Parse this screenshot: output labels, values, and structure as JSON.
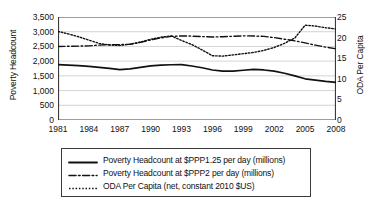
{
  "chart_data": {
    "type": "line",
    "title": "",
    "xlabel": "",
    "ylabel": "Poverty Headcount",
    "y2label": "ODA Per Capita",
    "grid": true,
    "legend_position": "bottom",
    "x": [
      1981,
      1982,
      1983,
      1984,
      1985,
      1986,
      1987,
      1988,
      1989,
      1990,
      1991,
      1992,
      1993,
      1994,
      1995,
      1996,
      1997,
      1998,
      1999,
      2000,
      2001,
      2002,
      2003,
      2004,
      2005,
      2006,
      2007,
      2008
    ],
    "xticks": [
      "1981",
      "1984",
      "1987",
      "1990",
      "1993",
      "1996",
      "1999",
      "2002",
      "2005",
      "2008"
    ],
    "yticks": [
      "0",
      "500",
      "1,000",
      "1,500",
      "2,000",
      "2,500",
      "3,000",
      "3,500"
    ],
    "y2ticks": [
      "0",
      "5",
      "10",
      "15",
      "20",
      "25"
    ],
    "ylim": [
      0,
      3500
    ],
    "y2lim": [
      0,
      25
    ],
    "xlim": [
      1981,
      2008
    ],
    "series": [
      {
        "name": "Poverty Headcount at $PPP1.25 per day (millions)",
        "axis": "left",
        "style": "solid",
        "color": "#111111",
        "values": [
          1880,
          1865,
          1845,
          1820,
          1790,
          1755,
          1712,
          1740,
          1790,
          1840,
          1865,
          1878,
          1880,
          1835,
          1775,
          1700,
          1660,
          1660,
          1690,
          1720,
          1700,
          1660,
          1590,
          1500,
          1400,
          1355,
          1310,
          1280
        ]
      },
      {
        "name": "Poverty Headcount at $PPP2 per day (millions)",
        "axis": "left",
        "style": "dashdot",
        "color": "#111111",
        "values": [
          2500,
          2505,
          2510,
          2520,
          2545,
          2560,
          2560,
          2575,
          2640,
          2720,
          2790,
          2840,
          2860,
          2850,
          2835,
          2820,
          2830,
          2845,
          2860,
          2855,
          2840,
          2800,
          2745,
          2690,
          2620,
          2545,
          2475,
          2420
        ]
      },
      {
        "name": "ODA Per Capita (net, constant 2010 $US)",
        "axis": "right",
        "style": "dotted",
        "color": "#111111",
        "values": [
          21.5,
          20.9,
          20.2,
          19.4,
          18.6,
          18.2,
          18.1,
          18.4,
          18.9,
          19.6,
          20.1,
          20.4,
          19.3,
          18.3,
          17.0,
          15.6,
          15.5,
          15.8,
          16.1,
          16.4,
          16.9,
          17.6,
          18.6,
          19.9,
          23.0,
          22.8,
          22.4,
          22.1
        ]
      }
    ]
  },
  "axes": {
    "left_title": "Poverty Headcount",
    "right_title": "ODA Per Capita"
  },
  "legend": {
    "items": [
      {
        "label": "Poverty Headcount at $PPP1.25 per day (millions)",
        "style": "solid"
      },
      {
        "label": "Poverty Headcount at $PPP2 per day (millions)",
        "style": "dashdot"
      },
      {
        "label": "ODA Per Capita (net, constant 2010 $US)",
        "style": "dotted"
      }
    ]
  }
}
